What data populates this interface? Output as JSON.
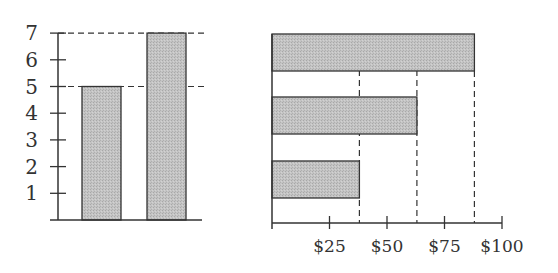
{
  "chart_data": [
    {
      "type": "bar",
      "orientation": "vertical",
      "title": "",
      "xlabel": "",
      "ylabel": "",
      "categories": [
        "A",
        "B"
      ],
      "values": [
        5,
        7
      ],
      "ylim": [
        0,
        7
      ],
      "yticks": [
        1,
        2,
        3,
        4,
        5,
        6,
        7
      ],
      "ytick_labels": [
        "1",
        "2",
        "3",
        "4",
        "5",
        "6",
        "7"
      ],
      "reference_lines": [
        {
          "axis": "y",
          "value": 5,
          "style": "dashed"
        },
        {
          "axis": "y",
          "value": 7,
          "style": "dashed"
        }
      ],
      "bar_fill": "#c2c2c2",
      "bar_stroke": "#333333",
      "grid": false
    },
    {
      "type": "bar",
      "orientation": "horizontal",
      "title": "",
      "xlabel": "",
      "ylabel": "",
      "categories": [
        "top",
        "middle",
        "bottom"
      ],
      "values": [
        88,
        63,
        38
      ],
      "xlim": [
        0,
        100
      ],
      "xticks": [
        25,
        50,
        75,
        100
      ],
      "xtick_labels": [
        "$25",
        "$50",
        "$75",
        "$100"
      ],
      "reference_lines": [
        {
          "axis": "x",
          "value": 38,
          "style": "dashed"
        },
        {
          "axis": "x",
          "value": 63,
          "style": "dashed"
        },
        {
          "axis": "x",
          "value": 88,
          "style": "dashed"
        }
      ],
      "bar_fill": "#c2c2c2",
      "bar_stroke": "#333333",
      "grid": false
    }
  ]
}
